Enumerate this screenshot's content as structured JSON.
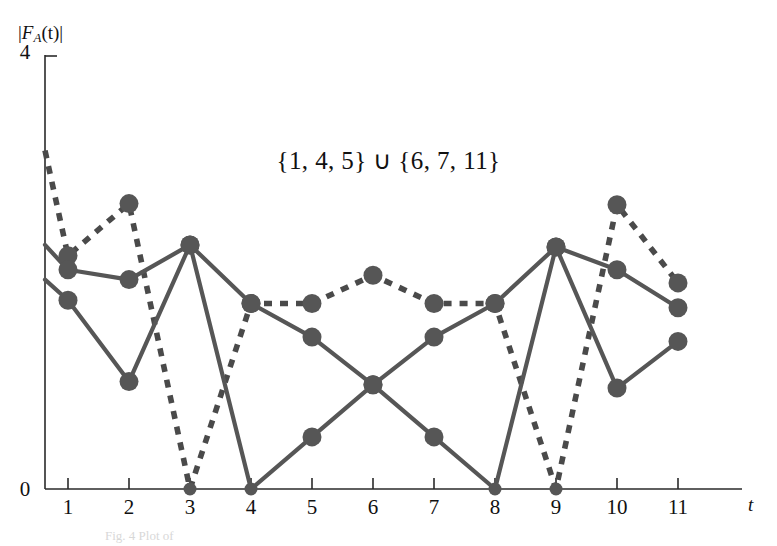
{
  "chart_data": {
    "type": "line",
    "title": "{1, 4, 5} ∪ {6, 7, 11}",
    "xlabel": "t",
    "ylabel": "|F_A(t)|",
    "ylabel_parts": {
      "bar_left": "|",
      "f": "F",
      "sub": "A",
      "arg": "(t)",
      "bar_right": "|"
    },
    "x": [
      1,
      2,
      3,
      4,
      5,
      6,
      7,
      8,
      9,
      10,
      11
    ],
    "xticklabels": [
      "1",
      "2",
      "3",
      "4",
      "5",
      "6",
      "7",
      "8",
      "9",
      "10",
      "11"
    ],
    "yticklabels": [
      "0",
      "4"
    ],
    "ylim": [
      0,
      4
    ],
    "xlim": [
      0.65,
      11.35
    ],
    "grid": false,
    "legend": "none",
    "series": [
      {
        "name": "dashed-series",
        "style": "dashed",
        "values": [
          2.15,
          2.63,
          0.0,
          1.71,
          1.71,
          1.97,
          1.71,
          1.71,
          0.0,
          2.62,
          1.9
        ],
        "leading_edge_value": 3.12
      },
      {
        "name": "solid-series-upper",
        "style": "solid",
        "values": [
          2.02,
          1.93,
          2.25,
          1.71,
          1.4,
          0.96,
          1.4,
          1.71,
          2.23,
          2.02,
          1.67
        ],
        "leading_edge_value": 2.25
      },
      {
        "name": "solid-series-lower",
        "style": "solid",
        "values": [
          1.74,
          0.99,
          2.25,
          0.0,
          0.48,
          0.96,
          0.48,
          0.0,
          2.23,
          0.93,
          1.36
        ],
        "leading_edge_value": 1.93
      }
    ]
  },
  "figure": {
    "caption": "Fig. 4 Plot of"
  }
}
